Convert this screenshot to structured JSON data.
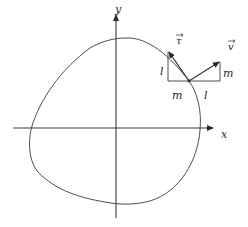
{
  "diagram": {
    "type": "closed curve with tangent and normal vectors",
    "axes": {
      "x_label": "x",
      "y_label": "y"
    },
    "vectors": {
      "tangent": {
        "label": "τ",
        "symbol": "⃗",
        "description": "tangent vector with components l (vertical) and m (horizontal)"
      },
      "normal": {
        "label": "v",
        "symbol": "⃗",
        "description": "normal vector with components l (horizontal) and m (vertical)"
      }
    },
    "triangle_labels": {
      "tangent_vertical": "l",
      "tangent_horizontal": "m",
      "normal_horizontal": "l",
      "normal_vertical": "m"
    },
    "colors": {
      "line": "#3a3a3a",
      "background": "#ffffff"
    }
  }
}
